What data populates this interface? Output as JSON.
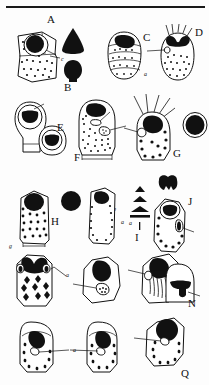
{
  "figure": {
    "type": "scientific-plate",
    "background_color": "#fdfdfd",
    "ink_color": "#111111",
    "top_rule": true
  },
  "panels": [
    {
      "id": "A",
      "label": "A",
      "annotations": [
        {
          "text": "c"
        }
      ]
    },
    {
      "id": "B",
      "label": "B",
      "annotations": []
    },
    {
      "id": "C",
      "label": "C",
      "annotations": []
    },
    {
      "id": "D",
      "label": "D",
      "annotations": [
        {
          "text": "a"
        }
      ]
    },
    {
      "id": "E",
      "label": "E",
      "annotations": [
        {
          "text": "c"
        },
        {
          "text": "g"
        }
      ]
    },
    {
      "id": "F",
      "label": "F",
      "annotations": [
        {
          "text": "p"
        },
        {
          "text": "a"
        }
      ]
    },
    {
      "id": "G",
      "label": "G",
      "annotations": [
        {
          "text": "a"
        }
      ]
    },
    {
      "id": "H",
      "label": "H",
      "annotations": []
    },
    {
      "id": "I",
      "label": "I",
      "annotations": []
    },
    {
      "id": "J",
      "label": "J",
      "annotations": [
        {
          "text": "a"
        }
      ]
    },
    {
      "id": "K",
      "label": "K",
      "annotations": [
        {
          "text": "a"
        }
      ]
    },
    {
      "id": "L",
      "label": "L",
      "annotations": []
    },
    {
      "id": "M",
      "label": "M",
      "annotations": [
        {
          "text": "a"
        }
      ]
    },
    {
      "id": "N",
      "label": "N",
      "annotations": [
        {
          "text": "a"
        }
      ]
    },
    {
      "id": "O",
      "label": "O",
      "annotations": [
        {
          "text": "a"
        }
      ]
    },
    {
      "id": "P",
      "label": "P",
      "annotations": []
    },
    {
      "id": "Q",
      "label": "Q",
      "annotations": [
        {
          "text": "a"
        }
      ]
    }
  ],
  "annotation_keys": [
    {
      "key": "a",
      "count": 8
    },
    {
      "key": "c",
      "count": 2
    },
    {
      "key": "g",
      "count": 1
    },
    {
      "key": "p",
      "count": 1
    }
  ]
}
